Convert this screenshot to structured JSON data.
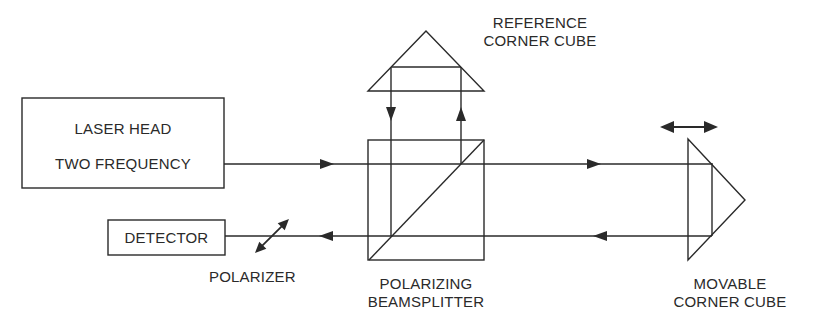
{
  "components": {
    "laser_head": {
      "line1": "LASER HEAD",
      "line2": "TWO FREQUENCY"
    },
    "detector": {
      "label": "DETECTOR"
    },
    "polarizer": {
      "label": "POLARIZER"
    },
    "beamsplitter": {
      "line1": "POLARIZING",
      "line2": "BEAMSPLITTER"
    },
    "reference_cube": {
      "line1": "REFERENCE",
      "line2": "CORNER CUBE"
    },
    "movable_cube": {
      "line1": "MOVABLE",
      "line2": "CORNER CUBE"
    }
  },
  "colors": {
    "line": "#2a2a2a",
    "background": "#ffffff"
  }
}
